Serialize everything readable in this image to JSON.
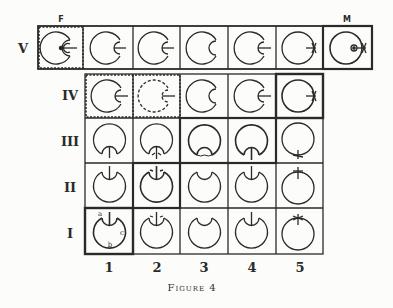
{
  "figure": {
    "caption": "Figure 4",
    "top_labels": {
      "F": "F",
      "M": "M"
    },
    "row_labels": [
      "V",
      "IV",
      "III",
      "II",
      "I"
    ],
    "column_labels": [
      "1",
      "2",
      "3",
      "4",
      "5"
    ],
    "cell_annotations": {
      "a": "a",
      "b": "b",
      "c": "c"
    },
    "colors": {
      "ink": "#2a2a2a",
      "paper": "#fcfcfa"
    }
  },
  "grid": {
    "top_row": {
      "label": "V",
      "cells": [
        {
          "id": "F",
          "glyph": "circle-inner-notch-right-with-center-dot",
          "border": "dashed"
        },
        {
          "id": "V-1",
          "glyph": "circle-inner-notch-right-stick"
        },
        {
          "id": "V-2",
          "glyph": "circle-inner-notch-right-stick"
        },
        {
          "id": "V-3",
          "glyph": "circle-inner-notch-right"
        },
        {
          "id": "V-4",
          "glyph": "circle-inner-notch-right-stick"
        },
        {
          "id": "V-5",
          "glyph": "circle-right-stick-cross"
        },
        {
          "id": "M",
          "glyph": "circle-right-stick-cross-with-dot",
          "border": "thick"
        }
      ]
    },
    "rows": [
      {
        "label": "IV",
        "cells": [
          "notch-right-stick (dashed box)",
          "dashed circle notch-right-stick (dashed box)",
          "notch-right",
          "notch-right-stick",
          "right-stick-cross (thick box)"
        ]
      },
      {
        "label": "III",
        "cells": [
          "notch-bottom-stick",
          "notch-bottom-stick-arrows",
          "notch-bottom-scalloped (grouped)",
          "notch-bottom-stick (grouped)",
          "bottom-stick-cross"
        ]
      },
      {
        "label": "II",
        "cells": [
          "notch-top-stick",
          "notch-top-stick-arrows (thick box)",
          "notch-top",
          "notch-top-stick",
          "top-stick-cross"
        ]
      },
      {
        "label": "I",
        "cells": [
          "notch-top-stick labelled a,b,c (thick box)",
          "notch-top-stick-arrows",
          "notch-top",
          "notch-top-stick",
          "top-stick-cross"
        ]
      }
    ]
  }
}
